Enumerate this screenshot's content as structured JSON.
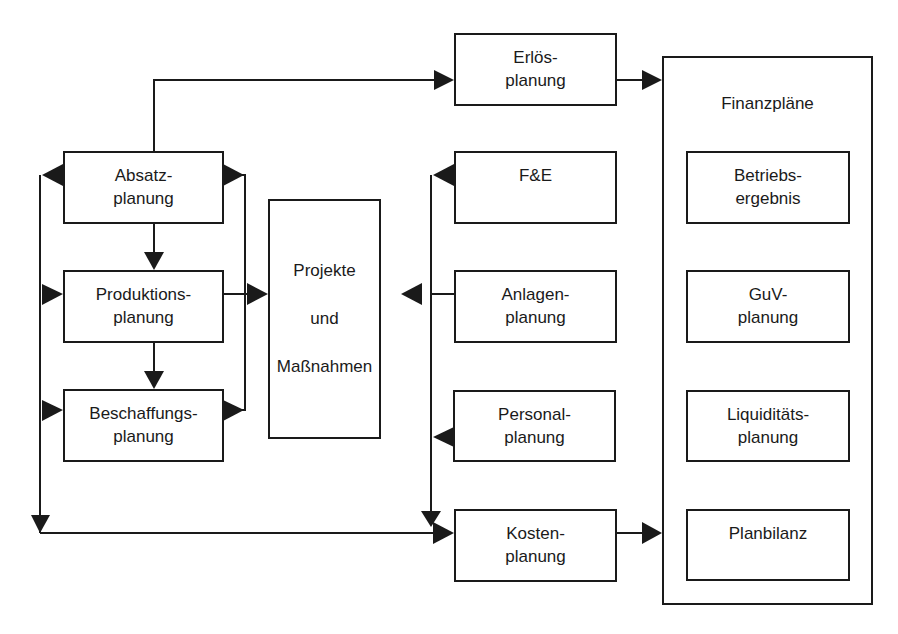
{
  "diagram": {
    "type": "flowchart",
    "left_group": [
      {
        "id": "absatz",
        "line1": "Absatz-",
        "line2": "planung"
      },
      {
        "id": "produktion",
        "line1": "Produktions-",
        "line2": "planung"
      },
      {
        "id": "beschaffung",
        "line1": "Beschaffungs-",
        "line2": "planung"
      }
    ],
    "center": {
      "id": "projekte",
      "line1": "Projekte",
      "line2": "und",
      "line3": "Maßnahmen"
    },
    "middle_group": [
      {
        "id": "erloes",
        "line1": "Erlös-",
        "line2": "planung"
      },
      {
        "id": "fue",
        "line1": "F&E",
        "line2": ""
      },
      {
        "id": "anlagen",
        "line1": "Anlagen-",
        "line2": "planung"
      },
      {
        "id": "personal",
        "line1": "Personal-",
        "line2": "planung"
      },
      {
        "id": "kosten",
        "line1": "Kosten-",
        "line2": "planung"
      }
    ],
    "finance": {
      "title": "Finanzpläne",
      "items": [
        {
          "id": "betrieb",
          "line1": "Betriebs-",
          "line2": "ergebnis"
        },
        {
          "id": "guv",
          "line1": "GuV-",
          "line2": "planung"
        },
        {
          "id": "liquiditaet",
          "line1": "Liquiditäts-",
          "line2": "planung"
        },
        {
          "id": "planbilanz",
          "line1": "Planbilanz",
          "line2": ""
        }
      ]
    },
    "edges": [
      {
        "from": "absatz",
        "to": "erloes"
      },
      {
        "from": "erloes",
        "to": "finanzplaene"
      },
      {
        "from": "absatz",
        "to": "produktion"
      },
      {
        "from": "produktion",
        "to": "beschaffung"
      },
      {
        "from": "absatz",
        "to": "projekte"
      },
      {
        "from": "produktion",
        "to": "projekte"
      },
      {
        "from": "beschaffung",
        "to": "projekte"
      },
      {
        "from": "left-bus",
        "to": "absatz"
      },
      {
        "from": "left-bus",
        "to": "produktion"
      },
      {
        "from": "left-bus",
        "to": "beschaffung"
      },
      {
        "from": "left-bus",
        "to": "kosten"
      },
      {
        "from": "anlagen",
        "to": "projekte"
      },
      {
        "from": "middle-bus",
        "to": "fue"
      },
      {
        "from": "middle-bus",
        "to": "personal"
      },
      {
        "from": "middle-bus",
        "to": "kosten"
      },
      {
        "from": "kosten",
        "to": "finanzplaene"
      }
    ],
    "colors": {
      "stroke": "#1a1a1a",
      "background": "#ffffff"
    }
  }
}
